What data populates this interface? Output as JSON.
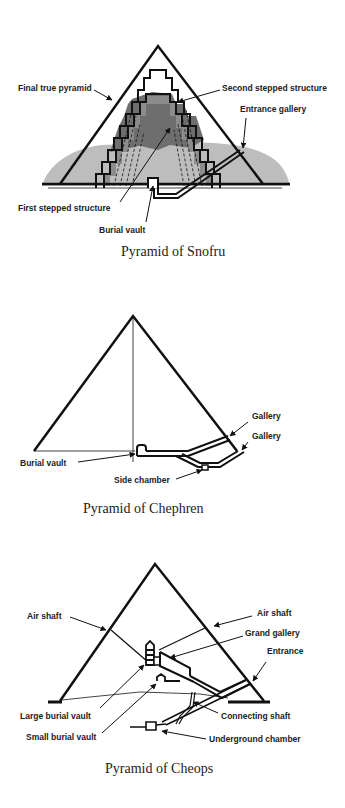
{
  "colors": {
    "ink": "#111111",
    "ground": "#bdbdbd",
    "core_dark": "#6e6e6e",
    "core_mid": "#8c8c8c",
    "background": "#ffffff"
  },
  "figures": [
    {
      "caption": "Pyramid of Snofru",
      "labels": {
        "final_true_pyramid": "Final true pyramid",
        "second_stepped_structure": "Second stepped structure",
        "entrance_gallery": "Entrance gallery",
        "first_stepped_structure": "First stepped structure",
        "burial_vault": "Burial vault"
      }
    },
    {
      "caption": "Pyramid of Chephren",
      "labels": {
        "gallery_upper": "Gallery",
        "gallery_lower": "Gallery",
        "burial_vault": "Burial vault",
        "side_chamber": "Side chamber"
      }
    },
    {
      "caption": "Pyramid of Cheops",
      "labels": {
        "air_shaft_left": "Air shaft",
        "air_shaft_right": "Air shaft",
        "grand_gallery": "Grand gallery",
        "entrance": "Entrance",
        "large_burial_vault": "Large burial vault",
        "connecting_shaft": "Connecting shaft",
        "small_burial_vault": "Small burial vault",
        "underground_chamber": "Underground chamber"
      }
    }
  ]
}
